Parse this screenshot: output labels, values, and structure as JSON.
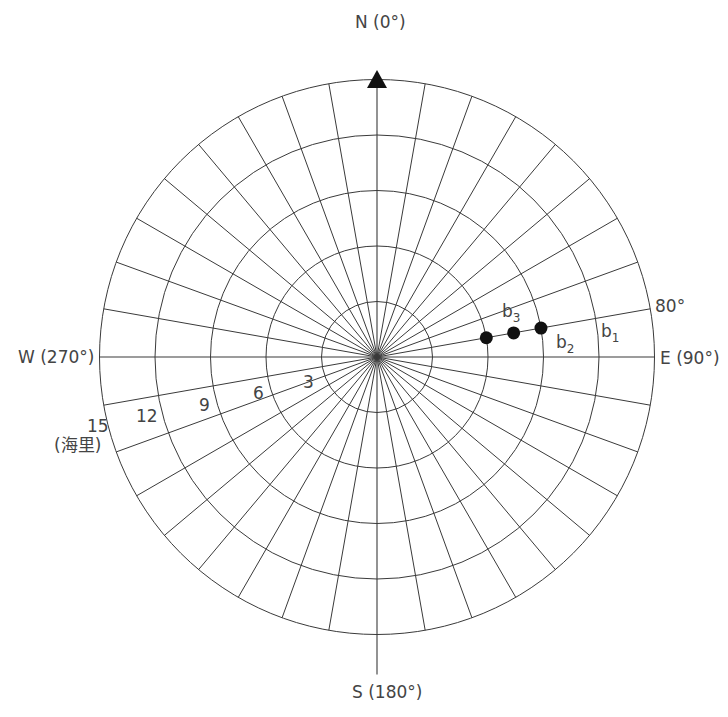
{
  "diagram": {
    "type": "polar_bearing_range_plot",
    "center": {
      "x": 377,
      "y": 357
    },
    "ring_spacing_px": 55.5,
    "rings": [
      3,
      6,
      9,
      12,
      15
    ],
    "ring_unit": "海里",
    "spoke_step_deg": 10,
    "directions": {
      "north": "N (0°)",
      "east": "E (90°)",
      "south": "S (180°)",
      "west": "W (270°)"
    },
    "bearing_label": "80°",
    "range_labels": [
      "3",
      "6",
      "9",
      "12",
      "15"
    ],
    "unit_label": "(海里)",
    "points": [
      {
        "name": "b",
        "sub": "1",
        "bearing": 80,
        "range": 9.0
      },
      {
        "name": "b",
        "sub": "2",
        "bearing": 80,
        "range": 7.5
      },
      {
        "name": "b",
        "sub": "3",
        "bearing": 80,
        "range": 6.0
      }
    ],
    "colors": {
      "grid": "#3a3a3a",
      "text": "#444444",
      "point": "#111111"
    }
  }
}
